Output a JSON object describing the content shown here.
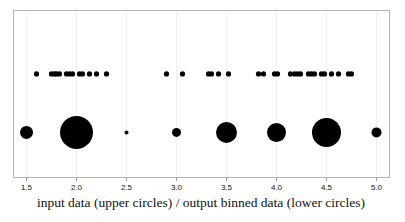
{
  "chart_data": {
    "type": "scatter",
    "title": "",
    "subtitle": "",
    "xlabel": "input data (upper circles) / output binned data (lower circles)",
    "ylabel": "",
    "xlim": [
      1.37,
      5.13
    ],
    "ylim": [
      0,
      1
    ],
    "xticks": [
      1.5,
      2.0,
      2.5,
      3.0,
      3.5,
      4.0,
      4.5,
      5.0
    ],
    "xtick_labels": [
      "1.5",
      "2.0",
      "2.5",
      "3.0",
      "3.5",
      "4.0",
      "4.5",
      "5.0"
    ],
    "yticks": [],
    "ytick_labels": [],
    "grid": "vertical-only",
    "legend": "none",
    "marker_color": "#000000",
    "frame_color": "#b5b5b5",
    "gridline_color": "#efefef",
    "series": [
      {
        "name": "input data (upper circles)",
        "row": "upper",
        "y": 0.62,
        "marker_size_mode": "uniform",
        "marker_radius": 2.6,
        "x": [
          1.6,
          1.75,
          1.78,
          1.8,
          1.83,
          1.9,
          1.93,
          1.96,
          2.03,
          2.06,
          2.13,
          2.2,
          2.3,
          2.9,
          3.06,
          3.32,
          3.35,
          3.42,
          3.52,
          3.82,
          3.87,
          3.98,
          4.01,
          4.14,
          4.18,
          4.21,
          4.24,
          4.32,
          4.35,
          4.38,
          4.45,
          4.48,
          4.55,
          4.62,
          4.72,
          4.75
        ]
      },
      {
        "name": "output binned data (lower circles)",
        "row": "lower",
        "y": 0.27,
        "marker_size_mode": "proportional-to-count",
        "x": [
          1.5,
          2.0,
          2.5,
          3.0,
          3.5,
          4.0,
          4.5,
          5.0
        ],
        "radii": [
          6.5,
          16.5,
          2.0,
          4.5,
          10.5,
          9.5,
          14.5,
          5.0
        ],
        "counts": [
          1,
          11,
          1,
          2,
          4,
          4,
          12,
          2
        ]
      }
    ]
  }
}
